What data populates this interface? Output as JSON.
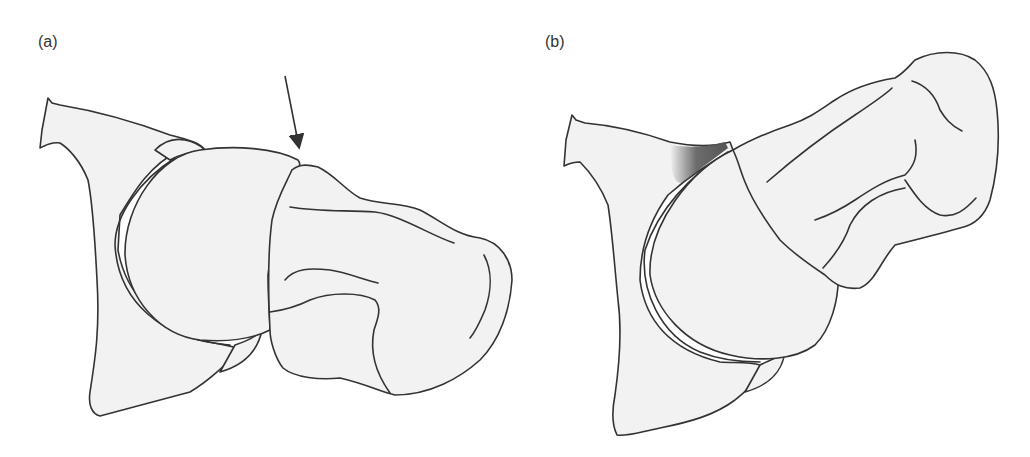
{
  "figure": {
    "panels": [
      {
        "id": "a",
        "label": "(a)",
        "annotation": "arrow pointing to junction of humeral head and greater tuberosity"
      },
      {
        "id": "b",
        "label": "(b)",
        "annotation": "dark shaded impingement region above humeral head"
      }
    ],
    "colors": {
      "bone_fill": "#f2f2f2",
      "outline": "#333333",
      "shaded_region": "#555555"
    }
  }
}
